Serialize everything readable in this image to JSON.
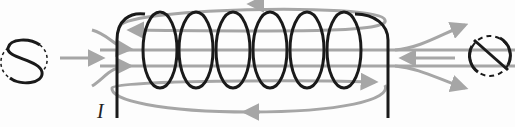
{
  "diagram": {
    "current_label": "I",
    "left_end_symbol": "S",
    "right_end_symbol": "N",
    "coil_turns": 6,
    "colors": {
      "coil": "#1a1a1a",
      "field_lines": "#a6a6a6",
      "background": "#fdfdfd"
    }
  }
}
